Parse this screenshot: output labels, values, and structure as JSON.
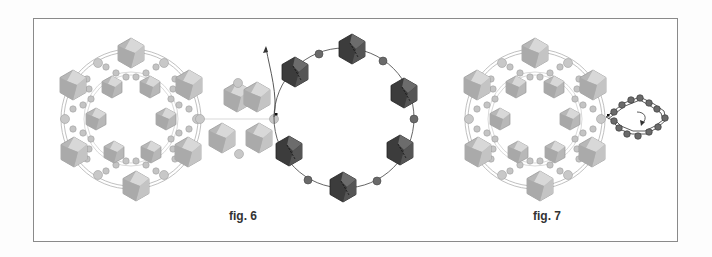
{
  "figures": [
    {
      "id": "fig6",
      "caption": "fig. 6",
      "caption_pos": {
        "x": 229,
        "y": 210
      }
    },
    {
      "id": "fig7",
      "caption": "fig. 7",
      "caption_pos": {
        "x": 533,
        "y": 210
      }
    }
  ],
  "colors": {
    "frame": "#8a8a8a",
    "light_crystal": "#bdbdbd",
    "light_crystal_face": "#d6d6d6",
    "light_crystal_edge": "#9e9e9e",
    "dark_crystal": "#3a3a3a",
    "dark_crystal_face": "#6e6e6e",
    "seed_bead_light": "#c8c8c8",
    "seed_bead_dark": "#6a6a6a",
    "thread": "#999999",
    "thread_dark": "#444444"
  }
}
